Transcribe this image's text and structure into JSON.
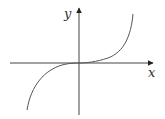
{
  "diagram": {
    "type": "function-graph",
    "function": "y = x^3",
    "axes": {
      "x_label": "x",
      "y_label": "y",
      "color": "#444444"
    },
    "curve": {
      "color": "#555555",
      "description": "cubic curve through origin, flat at origin, increasing"
    }
  }
}
